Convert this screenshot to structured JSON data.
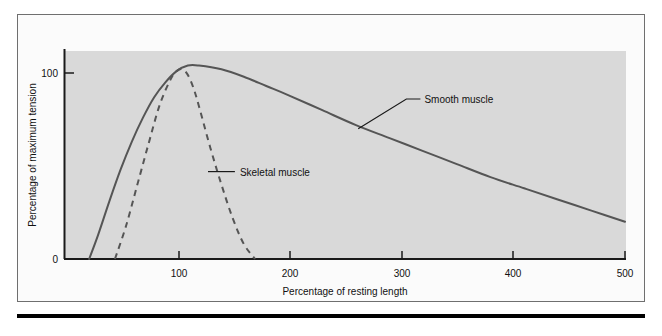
{
  "figure": {
    "background_color": "#ffffff",
    "frame_color": "#6f6f6f",
    "plot_background_color": "#d9d9d9",
    "axis_color": "#1a1a1a",
    "curve_color": "#555555",
    "rule_color": "#000000"
  },
  "chart_data": {
    "type": "line",
    "title": "",
    "xlabel": "Percentage of resting length",
    "ylabel": "Percentage of maximum tension",
    "xlim": [
      0,
      520
    ],
    "ylim": [
      0,
      115
    ],
    "xticks": [
      100,
      200,
      300,
      400,
      500
    ],
    "xtick_labels": [
      "100",
      "200",
      "300",
      "400",
      "500"
    ],
    "yticks": [
      0,
      100
    ],
    "ytick_labels": [
      "0",
      "100"
    ],
    "grid": false,
    "legend_position": "inline-annotations",
    "series": [
      {
        "name": "Smooth muscle",
        "style": "solid",
        "color": "#555555",
        "x": [
          22,
          30,
          40,
          50,
          60,
          70,
          80,
          90,
          100,
          110,
          120,
          140,
          160,
          180,
          200,
          230,
          260,
          290,
          320,
          350,
          380,
          410,
          440,
          470,
          500
        ],
        "y": [
          0,
          13,
          31,
          48,
          63,
          76,
          87,
          95,
          101,
          104,
          104,
          102,
          98,
          93,
          88,
          80,
          72,
          65,
          58,
          51,
          44,
          38,
          32,
          26,
          20
        ],
        "annotation": {
          "label": "Smooth muscle",
          "point_x": 262,
          "point_y": 70,
          "text_x": 305,
          "text_y": 86
        }
      },
      {
        "name": "Skeletal muscle",
        "style": "dashed",
        "color": "#555555",
        "x": [
          45,
          55,
          65,
          75,
          85,
          95,
          100,
          105,
          110,
          115,
          120,
          130,
          140,
          150,
          160,
          170
        ],
        "y": [
          0,
          18,
          40,
          62,
          83,
          97,
          101,
          102,
          99,
          92,
          82,
          60,
          40,
          22,
          8,
          0
        ],
        "annotation": {
          "label": "Skeletal muscle",
          "point_x": 128,
          "point_y": 47,
          "text_x": 152,
          "text_y": 47
        }
      }
    ]
  }
}
